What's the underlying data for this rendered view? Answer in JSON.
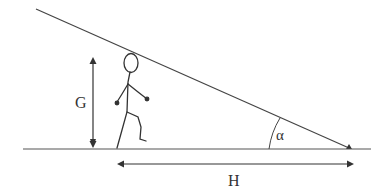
{
  "diagram": {
    "labels": {
      "height": "G",
      "distance": "H",
      "angle": "α"
    },
    "elements": {
      "incline_line": "sight line",
      "ground_line": "ground",
      "person": "stick figure walking"
    },
    "colors": {
      "stroke": "#333333",
      "background": "#ffffff"
    }
  }
}
